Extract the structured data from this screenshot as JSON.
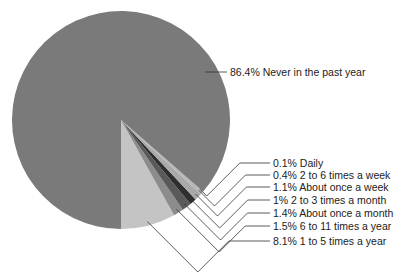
{
  "chart_data": {
    "type": "pie",
    "title": "",
    "legend": "none (leader-line labels on right)",
    "slices": [
      {
        "label": "Never in the past year",
        "value": 86.4,
        "color": "#7a7a7a",
        "text": "86.4% Never in the past year"
      },
      {
        "label": "Daily",
        "value": 0.1,
        "color": "#9a9a9a",
        "text": "0.1% Daily"
      },
      {
        "label": "2 to 6 times a week",
        "value": 0.4,
        "color": "#b8b8b8",
        "text": "0.4% 2 to 6 times a week"
      },
      {
        "label": "About once a week",
        "value": 1.1,
        "color": "#a9a9a9",
        "text": "1.1% About once a week"
      },
      {
        "label": "2 to 3 times a month",
        "value": 1.0,
        "color": "#2e2e2e",
        "text": "1% 2 to 3 times a month"
      },
      {
        "label": "About once a month",
        "value": 1.4,
        "color": "#5a5a5a",
        "text": "1.4% About once a month"
      },
      {
        "label": "6 to 11 times a year",
        "value": 1.5,
        "color": "#8c8c8c",
        "text": "1.5% 6 to 11 times a year"
      },
      {
        "label": "1 to 5 times a year",
        "value": 8.1,
        "color": "#c4c4c4",
        "text": "8.1% 1 to 5 times a year"
      }
    ]
  }
}
